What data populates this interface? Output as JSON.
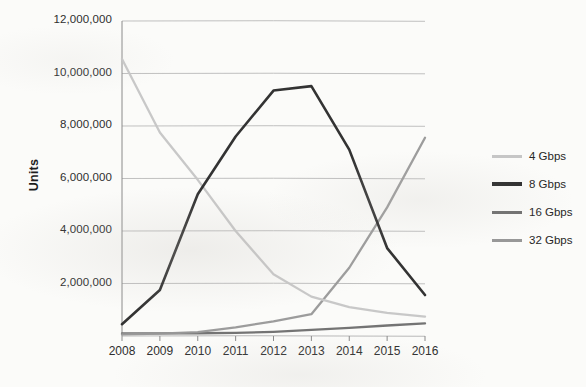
{
  "chart_data": {
    "type": "line",
    "title": "",
    "xlabel": "",
    "ylabel": "Units",
    "x": [
      2008,
      2009,
      2010,
      2011,
      2012,
      2013,
      2014,
      2015,
      2016
    ],
    "categories": [
      "2008",
      "2009",
      "2010",
      "2011",
      "2012",
      "2013",
      "2014",
      "2015",
      "2016"
    ],
    "ylim": [
      0,
      12000000
    ],
    "yticks": [
      0,
      2000000,
      4000000,
      6000000,
      8000000,
      10000000,
      12000000
    ],
    "ytick_labels": [
      "",
      "2,000,000",
      "4,000,000",
      "6,000,000",
      "8,000,000",
      "10,000,000",
      "12,000,000"
    ],
    "grid": true,
    "legend_position": "right",
    "series": [
      {
        "name": "4 Gbps",
        "color": "#c6c6c6",
        "values": [
          10550000,
          7750000,
          5950000,
          4000000,
          2350000,
          1500000,
          1100000,
          880000,
          740000
        ]
      },
      {
        "name": "8 Gbps",
        "color": "#2b2b2b",
        "values": [
          450000,
          1750000,
          5400000,
          7600000,
          9350000,
          9520000,
          7100000,
          3350000,
          1560000
        ]
      },
      {
        "name": "16 Gbps",
        "color": "#6e6e6e",
        "values": [
          100000,
          100000,
          105000,
          120000,
          160000,
          230000,
          310000,
          400000,
          480000
        ]
      },
      {
        "name": "32 Gbps",
        "color": "#989898",
        "values": [
          60000,
          90000,
          150000,
          330000,
          560000,
          830000,
          2600000,
          4900000,
          7550000
        ]
      }
    ]
  },
  "axis": {
    "y_title": "Units"
  },
  "legend": {
    "items": [
      {
        "label": "4 Gbps"
      },
      {
        "label": "8 Gbps"
      },
      {
        "label": "16 Gbps"
      },
      {
        "label": "32 Gbps"
      }
    ]
  },
  "colors": {
    "background": "#fbfbf9",
    "gridline": "#b9b9b9",
    "axis": "#8a8a8a",
    "text": "#2e2e2e"
  }
}
